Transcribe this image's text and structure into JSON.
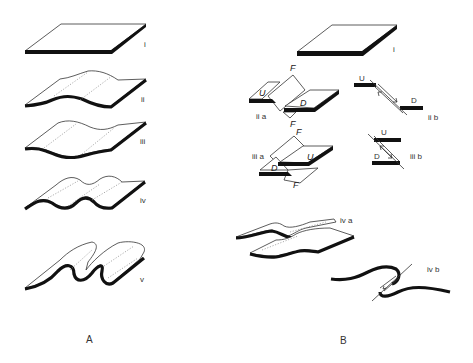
{
  "figure": {
    "panels": [
      {
        "id": "A",
        "label": "A",
        "stages": [
          {
            "label": "i",
            "shape": "flat layer"
          },
          {
            "label": "ii",
            "shape": "gentle fold"
          },
          {
            "label": "iii",
            "shape": "open fold"
          },
          {
            "label": "iv",
            "shape": "tighter folds"
          },
          {
            "label": "v",
            "shape": "overturned / recumbent folds"
          }
        ]
      },
      {
        "id": "B",
        "label": "B",
        "stages": [
          {
            "label": "i",
            "shape": "flat layer"
          },
          {
            "label": "ii a",
            "shape": "block faulted layer",
            "letters": [
              "F",
              "U",
              "D",
              "F"
            ]
          },
          {
            "label": "ii b",
            "shape": "normal fault section",
            "letters": [
              "U",
              "D"
            ]
          },
          {
            "label": "iii a",
            "shape": "block faulted layer",
            "letters": [
              "F",
              "D",
              "U",
              "F"
            ]
          },
          {
            "label": "iii b",
            "shape": "reverse fault section",
            "letters": [
              "U",
              "D"
            ]
          },
          {
            "label": "iv a",
            "shape": "folded and faulted layer"
          },
          {
            "label": "iv b",
            "shape": "fold-fault section"
          }
        ]
      }
    ],
    "labels": {
      "A": "A",
      "B": "B",
      "Ai": "i",
      "Aii": "ii",
      "Aiii": "iii",
      "Aiv": "iv",
      "Av": "v",
      "Bi": "i",
      "Biia": "ii a",
      "Biib": "ii b",
      "Biiia": "iii a",
      "Biiib": "iii b",
      "Biva": "iv a",
      "Bivb": "iv b",
      "F": "F",
      "U": "U",
      "D": "D"
    }
  }
}
